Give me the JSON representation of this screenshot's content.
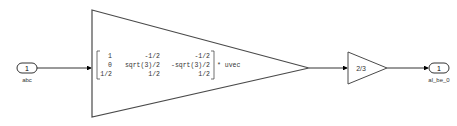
{
  "diagram": {
    "inport": {
      "number": "1",
      "label": "abc"
    },
    "matrix_gain": {
      "rows": [
        [
          "1",
          "-1/2",
          "-1/2"
        ],
        [
          "0",
          "sqrt(3)/2",
          "-sqrt(3)/2"
        ],
        [
          "1/2",
          "1/2",
          "1/2"
        ]
      ],
      "suffix": "* uvec"
    },
    "gain": {
      "value": "2/3"
    },
    "outport": {
      "number": "1",
      "label": "al_be_0"
    },
    "colors": {
      "line": "#000000",
      "block_border": "#4a4a4a",
      "background": "#ffffff"
    }
  }
}
